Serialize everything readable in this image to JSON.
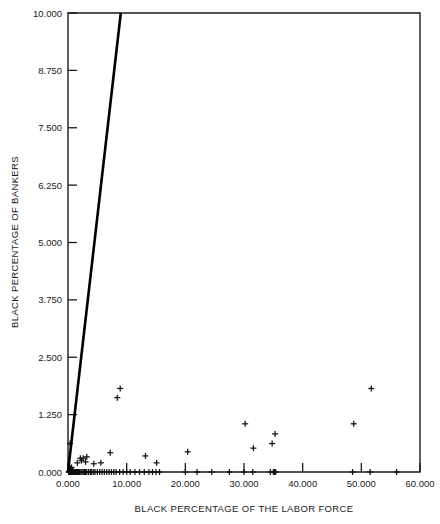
{
  "figure": {
    "background_color": "#ffffff",
    "foreground_color": "#1a1a1a",
    "marker_symbol": "+",
    "line_color": "#000000"
  },
  "chart_data": {
    "type": "scatter",
    "title": "",
    "xlabel": "BLACK PERCENTAGE OF THE LABOR FORCE",
    "ylabel": "BLACK PERCENTAGE OF BANKERS",
    "xlim": [
      0.0,
      60.0
    ],
    "ylim": [
      0.0,
      10.0
    ],
    "xticks": [
      0.0,
      10.0,
      20.0,
      30.0,
      40.0,
      50.0,
      60.0
    ],
    "yticks": [
      0.0,
      1.25,
      2.5,
      3.75,
      5.0,
      6.25,
      7.5,
      8.75,
      10.0
    ],
    "xtick_labels": [
      "0.000",
      "10.000",
      "20.000",
      "30.000",
      "40.000",
      "50.000",
      "60.000"
    ],
    "ytick_labels": [
      "0.000",
      "1.250",
      "2.500",
      "3.750",
      "5.000",
      "6.250",
      "7.500",
      "8.750",
      "10.000"
    ],
    "grid": false,
    "legend": null,
    "tick_direction": "in",
    "series": [
      {
        "name": "observations",
        "marker": "+",
        "x": [
          0.12,
          0.18,
          0.2,
          0.25,
          0.3,
          0.3,
          0.35,
          0.4,
          0.4,
          0.45,
          0.5,
          0.5,
          0.55,
          0.6,
          0.6,
          0.65,
          0.7,
          0.7,
          0.75,
          0.8,
          0.85,
          0.9,
          0.95,
          1.0,
          1.05,
          1.1,
          1.2,
          1.3,
          1.4,
          1.5,
          1.6,
          1.7,
          1.8,
          1.9,
          2.0,
          2.2,
          2.4,
          2.6,
          2.8,
          3.0,
          3.2,
          3.5,
          3.8,
          4.0,
          4.3,
          4.6,
          5.0,
          5.4,
          5.8,
          6.2,
          6.6,
          7.0,
          7.4,
          7.8,
          8.2,
          8.8,
          9.4,
          10.0,
          10.6,
          11.4,
          12.2,
          13.0,
          13.8,
          14.4,
          15.0,
          15.6,
          20.0,
          22.0,
          24.5,
          27.5,
          30.0,
          31.5,
          34.5,
          35.0,
          35.2,
          35.4,
          48.5,
          51.5,
          56.0,
          0.35,
          1.6,
          2.1,
          2.3,
          2.6,
          3.0,
          3.2,
          4.4,
          5.6,
          7.2,
          8.4,
          8.9,
          13.2,
          15.1,
          20.4,
          30.2,
          31.6,
          34.8,
          35.3,
          48.7,
          51.7
        ],
        "y": [
          0.0,
          0.0,
          0.0,
          0.0,
          0.0,
          0.05,
          0.0,
          0.0,
          0.08,
          0.0,
          0.0,
          0.06,
          0.0,
          0.0,
          0.1,
          0.0,
          0.0,
          0.05,
          0.0,
          0.0,
          0.0,
          0.0,
          0.0,
          0.0,
          0.0,
          0.0,
          0.0,
          0.0,
          0.0,
          0.0,
          0.0,
          0.0,
          0.0,
          0.0,
          0.0,
          0.0,
          0.0,
          0.0,
          0.0,
          0.0,
          0.0,
          0.0,
          0.0,
          0.0,
          0.0,
          0.0,
          0.0,
          0.0,
          0.0,
          0.0,
          0.0,
          0.0,
          0.0,
          0.0,
          0.0,
          0.0,
          0.0,
          0.0,
          0.0,
          0.0,
          0.0,
          0.0,
          0.0,
          0.0,
          0.0,
          0.0,
          0.0,
          0.0,
          0.0,
          0.0,
          0.0,
          0.0,
          0.0,
          0.0,
          0.0,
          0.0,
          0.0,
          0.0,
          0.0,
          0.62,
          0.2,
          0.3,
          0.25,
          0.3,
          0.22,
          0.33,
          0.18,
          0.2,
          0.42,
          1.62,
          1.82,
          0.35,
          0.2,
          0.44,
          1.05,
          0.52,
          0.62,
          0.83,
          1.05,
          1.82
        ]
      }
    ],
    "fit_line": {
      "name": "regression-line",
      "x": [
        0.0,
        9.0
      ],
      "y": [
        0.0,
        10.0
      ],
      "color": "#000000"
    }
  }
}
